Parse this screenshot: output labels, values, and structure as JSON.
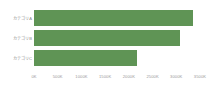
{
  "chart_data": {
    "type": "bar",
    "orientation": "horizontal",
    "title": "",
    "xlabel": "",
    "ylabel": "",
    "categories": [
      "カテゴリA",
      "カテゴリB",
      "カテゴリC"
    ],
    "values": [
      3350,
      3080,
      2170
    ],
    "value_unit": "K",
    "series": [
      {
        "name": "",
        "values": [
          3350,
          3080,
          2170
        ],
        "color": "#5f9455"
      }
    ],
    "xlim": [
      0,
      3500
    ],
    "xticks": [
      0,
      500,
      1000,
      1500,
      2000,
      2500,
      3000,
      3500
    ],
    "xtick_labels": [
      "0K",
      "500K",
      "1000K",
      "1500K",
      "2000K",
      "2500K",
      "3000K",
      "3500K"
    ],
    "grid": false,
    "legend": false,
    "legend_position": "none",
    "background_color": "#ffffff",
    "bar_color": "#5f9455",
    "tick_label_color": "#9a9a9a",
    "category_label_color": "#8a8a8a"
  }
}
